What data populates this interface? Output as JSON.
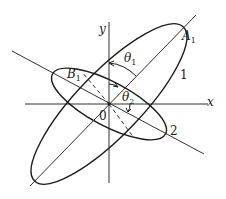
{
  "diagram": {
    "axes": {
      "x_label": "x",
      "y_label": "y",
      "origin_label": "0"
    },
    "ellipses": [
      {
        "label": "1",
        "point_label": "A",
        "point_sub": "1",
        "angle_label": "θ",
        "angle_sub": "1"
      },
      {
        "label": "2",
        "point_label": "B",
        "point_sub": "1",
        "angle_label": "θ",
        "angle_sub": "2"
      }
    ],
    "colors": {
      "stroke": "#1a1a1a",
      "background": "#ffffff"
    }
  }
}
